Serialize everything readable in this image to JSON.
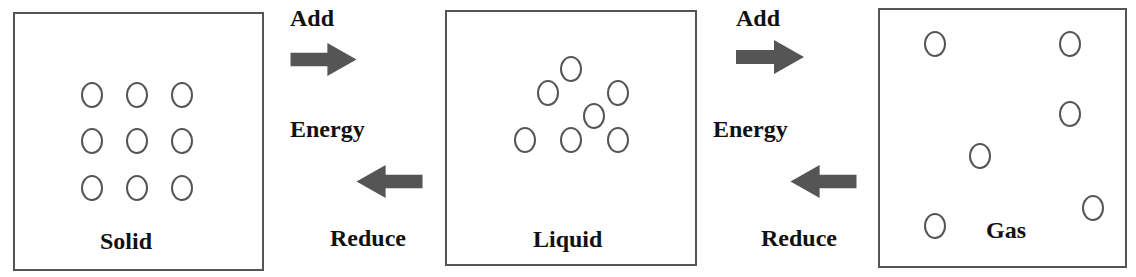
{
  "diagram": {
    "type": "states-of-matter",
    "states": [
      {
        "id": "solid",
        "label": "Solid",
        "box": {
          "x": 13,
          "y": 12,
          "w": 251,
          "h": 259
        },
        "label_pos": {
          "x": 100,
          "y": 229
        },
        "particles": [
          [
            92,
            95
          ],
          [
            137,
            95
          ],
          [
            182,
            95
          ],
          [
            92,
            141
          ],
          [
            137,
            141
          ],
          [
            182,
            141
          ],
          [
            92,
            188
          ],
          [
            137,
            188
          ],
          [
            182,
            188
          ]
        ]
      },
      {
        "id": "liquid",
        "label": "Liquid",
        "box": {
          "x": 445,
          "y": 10,
          "w": 252,
          "h": 256
        },
        "label_pos": {
          "x": 533,
          "y": 227
        },
        "particles": [
          [
            571,
            69
          ],
          [
            548,
            93
          ],
          [
            618,
            93
          ],
          [
            594,
            116
          ],
          [
            525,
            140
          ],
          [
            571,
            140
          ],
          [
            618,
            140
          ]
        ]
      },
      {
        "id": "gas",
        "label": "Gas",
        "box": {
          "x": 878,
          "y": 8,
          "w": 249,
          "h": 260
        },
        "label_pos": {
          "x": 986,
          "y": 218
        },
        "particles": [
          [
            935,
            44
          ],
          [
            1070,
            44
          ],
          [
            1070,
            114
          ],
          [
            980,
            156
          ],
          [
            1093,
            208
          ],
          [
            935,
            226
          ]
        ]
      }
    ],
    "transitions": [
      {
        "from": "solid",
        "to": "liquid",
        "add_label": "Add",
        "energy_label": "Energy",
        "reduce_label": "Reduce",
        "add_pos": {
          "x": 290,
          "y": 6
        },
        "energy_pos": {
          "x": 290,
          "y": 117
        },
        "reduce_pos": {
          "x": 330,
          "y": 226
        },
        "right_arrow": {
          "x": 289,
          "y": 43,
          "w": 69,
          "h": 33
        },
        "left_arrow": {
          "x": 355,
          "y": 165,
          "w": 69,
          "h": 33
        }
      },
      {
        "from": "liquid",
        "to": "gas",
        "add_label": "Add",
        "energy_label": "Energy",
        "reduce_label": "Reduce",
        "add_pos": {
          "x": 736,
          "y": 6
        },
        "energy_pos": {
          "x": 713,
          "y": 117
        },
        "reduce_pos": {
          "x": 761,
          "y": 226
        },
        "right_arrow": {
          "x": 736,
          "y": 40,
          "w": 68,
          "h": 34
        },
        "left_arrow": {
          "x": 789,
          "y": 165,
          "w": 69,
          "h": 33
        }
      }
    ],
    "colors": {
      "arrow": "#555555",
      "border": "#555555",
      "text": "#111111"
    }
  }
}
